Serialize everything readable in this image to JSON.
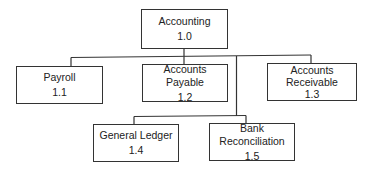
{
  "diagram": {
    "type": "hierarchy-chart",
    "root": {
      "label": "Accounting",
      "number": "1.0"
    },
    "children": [
      {
        "label": "Payroll",
        "number": "1.1"
      },
      {
        "label": "Accounts Payable",
        "number": "1.2"
      },
      {
        "label": "Accounts Receivable",
        "label_lines": [
          "Accounts",
          "Receivable"
        ],
        "number": "1.3"
      },
      {
        "label": "General Ledger",
        "number": "1.4"
      },
      {
        "label": "Bank Reconciliation",
        "number": "1.5"
      }
    ],
    "colors": {
      "line": "#333333",
      "background": "#ffffff",
      "text": "#222222"
    }
  }
}
